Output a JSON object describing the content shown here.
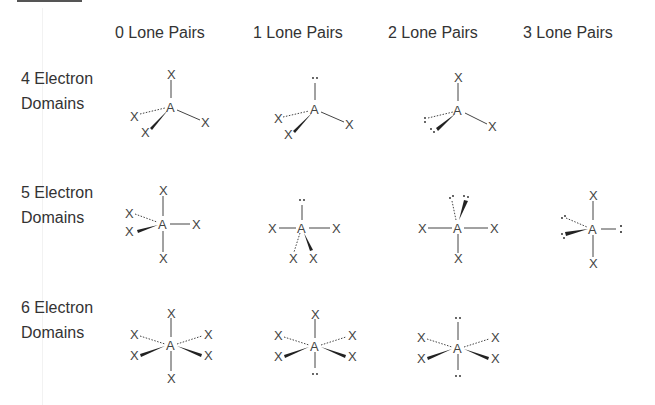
{
  "table": {
    "column_headers": [
      "0 Lone Pairs",
      "1 Lone Pairs",
      "2 Lone Pairs",
      "3 Lone Pairs"
    ],
    "row_labels": [
      {
        "line1": "4 Electron",
        "line2": "Domains"
      },
      {
        "line1": "5 Electron",
        "line2": "Domains"
      },
      {
        "line1": "6 Electron",
        "line2": "Domains"
      }
    ]
  },
  "symbols": {
    "central_atom": "A",
    "ligand": "X",
    "lone_pair": ":"
  },
  "cells": [
    {
      "row": "4 Electron Domains",
      "col": "0 Lone Pairs",
      "ligands": 4,
      "lone_pairs": 0
    },
    {
      "row": "4 Electron Domains",
      "col": "1 Lone Pairs",
      "ligands": 3,
      "lone_pairs": 1
    },
    {
      "row": "4 Electron Domains",
      "col": "2 Lone Pairs",
      "ligands": 2,
      "lone_pairs": 2
    },
    {
      "row": "5 Electron Domains",
      "col": "0 Lone Pairs",
      "ligands": 5,
      "lone_pairs": 0
    },
    {
      "row": "5 Electron Domains",
      "col": "1 Lone Pairs",
      "ligands": 4,
      "lone_pairs": 1
    },
    {
      "row": "5 Electron Domains",
      "col": "2 Lone Pairs",
      "ligands": 3,
      "lone_pairs": 2
    },
    {
      "row": "5 Electron Domains",
      "col": "3 Lone Pairs",
      "ligands": 2,
      "lone_pairs": 3
    },
    {
      "row": "6 Electron Domains",
      "col": "0 Lone Pairs",
      "ligands": 6,
      "lone_pairs": 0
    },
    {
      "row": "6 Electron Domains",
      "col": "1 Lone Pairs",
      "ligands": 5,
      "lone_pairs": 1
    },
    {
      "row": "6 Electron Domains",
      "col": "2 Lone Pairs",
      "ligands": 4,
      "lone_pairs": 2
    }
  ],
  "colors": {
    "text": "#333333",
    "bond": "#444444",
    "top_bar": "#555555"
  }
}
